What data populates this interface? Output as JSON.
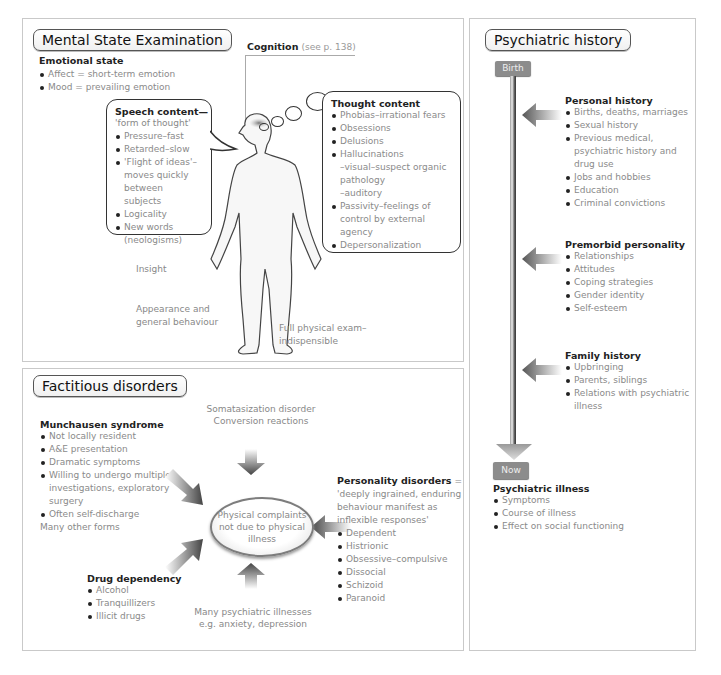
{
  "mse": {
    "title": "Mental State Examination",
    "emotional_state": {
      "heading": "Emotional state",
      "items": [
        "Affect = short-term emotion",
        "Mood = prevailing emotion"
      ]
    },
    "cognition": {
      "label": "Cognition",
      "ref": "(see p. 138)"
    },
    "speech": {
      "heading": "Speech content—",
      "subheading": "'form of thought'",
      "items": [
        "Pressure–fast",
        "Retarded–slow",
        "'Flight of ideas'– moves quickly between subjects",
        "Logicality",
        "New words (neologisms)"
      ]
    },
    "thought": {
      "heading": "Thought content",
      "items": [
        "Phobias–irrational fears",
        "Obsessions",
        "Delusions",
        "Hallucinations",
        "Passivity–feelings of control by external agency",
        "Depersonalization"
      ],
      "hallucination_sub": [
        "–visual–suspect organic pathology",
        "–auditory"
      ]
    },
    "insight": "Insight",
    "appearance": [
      "Appearance and",
      "general behaviour"
    ],
    "physical_exam": [
      "Full physical  exam–",
      "indispensible"
    ],
    "figure_icon": "human-body-outline"
  },
  "factitious": {
    "title": "Factitious disorders",
    "somatization": [
      "Somatasization disorder",
      "Conversion reactions"
    ],
    "munchausen": {
      "heading": "Munchausen syndrome",
      "items": [
        "Not locally resident",
        "A&E presentation",
        "Dramatic symptoms",
        "Willing to undergo multiple investigations, exploratory surgery",
        "Often self-discharge"
      ],
      "footer": "Many other forms"
    },
    "center": [
      "Physical complaints",
      "not due to physical",
      "illness"
    ],
    "personality": {
      "heading": "Personality disorders",
      "equals": " =",
      "definition": [
        "'deeply ingrained, enduring",
        "behaviour manifest as",
        "inflexible responses'"
      ],
      "items": [
        "Dependent",
        "Histrionic",
        "Obsessive–compulsive",
        "Dissocial",
        "Schizoid",
        "Paranoid"
      ]
    },
    "drug": {
      "heading": "Drug dependency",
      "items": [
        "Alcohol",
        "Tranquillizers",
        "Illicit drugs"
      ]
    },
    "psychiatric": [
      "Many psychiatric illnesses",
      "e.g. anxiety, depression"
    ]
  },
  "history": {
    "title": "Psychiatric history",
    "start_label": "Birth",
    "end_label": "Now",
    "personal": {
      "heading": "Personal history",
      "items": [
        "Births, deaths, marriages",
        "Sexual history",
        "Previous medical, psychiatric history and drug use",
        "Jobs and hobbies",
        "Education",
        "Criminal convictions"
      ]
    },
    "premorbid": {
      "heading": "Premorbid personality",
      "items": [
        "Relationships",
        "Attitudes",
        "Coping strategies",
        "Gender identity",
        "Self-esteem"
      ]
    },
    "family": {
      "heading": "Family history",
      "items": [
        "Upbringing",
        "Parents, siblings",
        "Relations with psychiatric illness"
      ]
    },
    "illness": {
      "heading": "Psychiatric illness",
      "items": [
        "Symptoms",
        "Course of illness",
        "Effect on social functioning"
      ]
    }
  },
  "colors": {
    "tag": "#8c8c8c",
    "border": "#c9c9c9",
    "text_muted": "#8a8a8a",
    "heading": "#222222"
  }
}
